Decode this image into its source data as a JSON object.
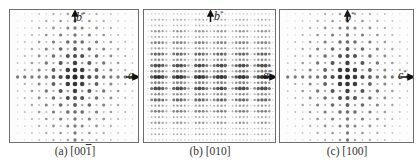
{
  "figure": {
    "panels": [
      {
        "id": "a",
        "caption_prefix": "(a) [00",
        "caption_over": "1",
        "caption_suffix": "]",
        "vertical_axis": "b",
        "vertical_axis_sup": "*",
        "horizontal_axis": "a",
        "horizontal_axis_sup": "",
        "pattern": "cross",
        "cols": 17,
        "rows": 18
      },
      {
        "id": "b",
        "caption_prefix": "(b) [010]",
        "caption_over": "",
        "caption_suffix": "",
        "vertical_axis": "b",
        "vertical_axis_sup": "*",
        "horizontal_axis": "a",
        "horizontal_axis_sup": "*",
        "pattern": "dense",
        "cols": 34,
        "rows": 22
      },
      {
        "id": "c",
        "caption_prefix": "(c) [100]",
        "caption_over": "",
        "caption_suffix": "",
        "vertical_axis": "b",
        "vertical_axis_sup": "*",
        "horizontal_axis": "c",
        "horizontal_axis_sup": "*",
        "pattern": "cross",
        "cols": 17,
        "rows": 18
      }
    ],
    "colors": {
      "border": "#6e6e6e",
      "spot": "#1e1e1e",
      "text": "#333333"
    }
  }
}
